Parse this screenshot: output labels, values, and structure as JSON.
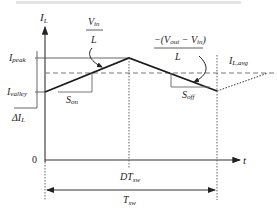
{
  "diagram": {
    "type": "inductor-current-waveform",
    "y_axis_label": "I",
    "y_axis_label_sub": "L",
    "x_axis_label": "t",
    "origin_label": "0",
    "levels": {
      "peak": {
        "label": "I",
        "sub": "peak"
      },
      "valley": {
        "label": "I",
        "sub": "valley"
      },
      "ripple": {
        "label": "ΔI",
        "sub": "L"
      },
      "average": {
        "label": "I",
        "sub": "L,avg"
      }
    },
    "slopes": {
      "on": {
        "label": "S",
        "sub": "on",
        "numerator": "V",
        "numerator_sub": "in",
        "denominator": "L"
      },
      "off": {
        "label": "S",
        "sub": "off",
        "numerator_prefix": "−(V",
        "numerator_sub1": "out",
        "numerator_mid": " − V",
        "numerator_sub2": "in",
        "numerator_suffix": ")",
        "denominator": "L"
      }
    },
    "time_marks": {
      "duty": {
        "label": "DT",
        "sub": "sw"
      },
      "period": {
        "label": "T",
        "sub": "sw"
      }
    },
    "colors": {
      "line": "#1a1a1a",
      "axis": "#333333",
      "dashed": "#777777"
    }
  }
}
